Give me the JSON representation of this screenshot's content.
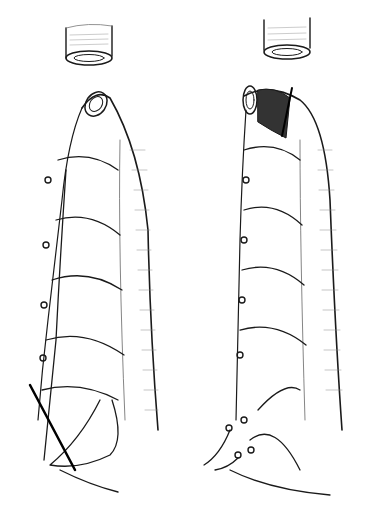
{
  "figure": {
    "type": "medical-line-illustration",
    "panels": [
      {
        "id": "left",
        "features": [
          "detached-proximal-segment",
          "distal-limb",
          "vessel-arcades",
          "ligatures",
          "diagonal-resection-line"
        ]
      },
      {
        "id": "right",
        "features": [
          "detached-proximal-segment",
          "distal-limb-shaded-end",
          "vessel-arcades",
          "ligatures",
          "divided-vessel-stumps",
          "transection-line"
        ]
      }
    ],
    "colors": {
      "ink": "#1a1a1a",
      "hatch": "#555555",
      "background": "#ffffff"
    }
  }
}
